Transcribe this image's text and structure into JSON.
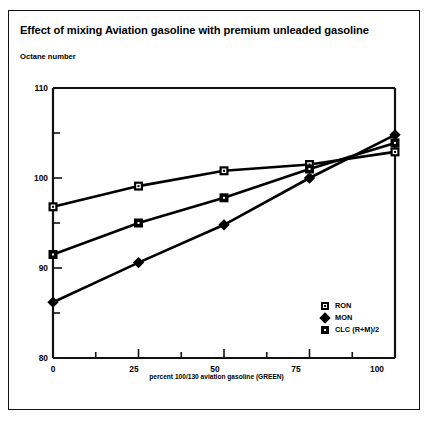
{
  "chart_title": "Effect of mixing Aviation gasoline with premium unleaded gasoline",
  "axis": {
    "ylabel": "Octane number",
    "xlabel": "percent 100/130 aviation gasoline (GREEN)",
    "ytick_labels": [
      "110",
      "100",
      "90",
      "80"
    ],
    "xtick_labels": [
      "0",
      "25",
      "50",
      "75",
      "100"
    ]
  },
  "legend": {
    "items": [
      {
        "label": "RON",
        "marker": "open-square-marker"
      },
      {
        "label": "MON",
        "marker": "filled-diamond-marker"
      },
      {
        "label": "CLC (R+M)/2",
        "marker": "filled-square-marker"
      }
    ]
  },
  "chart_data": {
    "type": "line",
    "title": "Effect of mixing Aviation gasoline with premium unleaded gasoline",
    "xlabel": "percent 100/130 aviation gasoline (GREEN)",
    "ylabel": "Octane number",
    "x": [
      0,
      25,
      50,
      75,
      100
    ],
    "xlim": [
      0,
      100
    ],
    "ylim": [
      80,
      110
    ],
    "xticks": [
      0,
      25,
      50,
      75,
      100
    ],
    "yticks": [
      80,
      90,
      100,
      110
    ],
    "yminorticks": [
      85,
      95,
      105
    ],
    "xminorticks": [
      12.5,
      37.5,
      62.5,
      87.5
    ],
    "grid": false,
    "legend_position": "lower-right",
    "series": [
      {
        "name": "RON",
        "marker": "open-square",
        "values": [
          96.8,
          99.1,
          100.8,
          101.5,
          102.9
        ]
      },
      {
        "name": "MON",
        "marker": "filled-diamond",
        "values": [
          86.2,
          90.6,
          94.8,
          100.0,
          104.8
        ]
      },
      {
        "name": "CLC (R+M)/2",
        "marker": "filled-square",
        "values": [
          91.5,
          95.0,
          97.8,
          101.0,
          103.9
        ]
      }
    ]
  }
}
